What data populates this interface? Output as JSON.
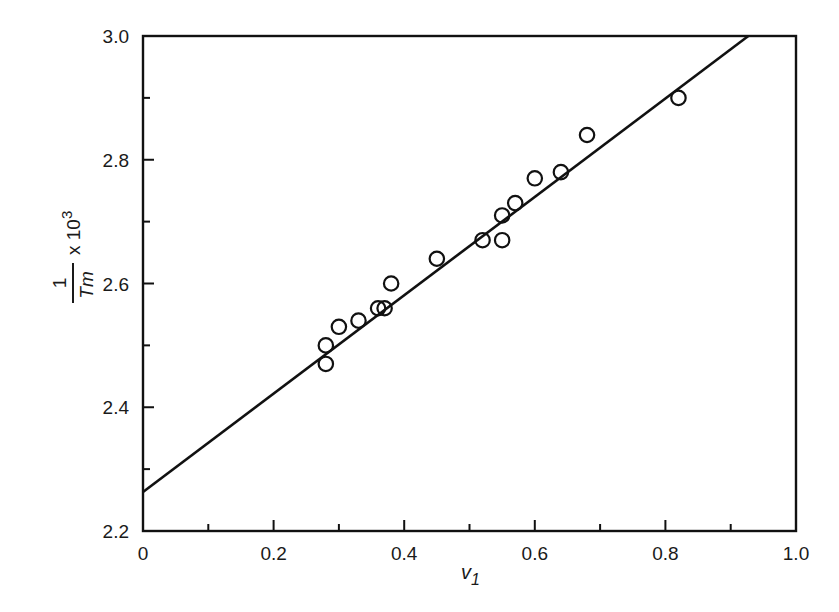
{
  "chart_data": {
    "type": "scatter",
    "title": "",
    "xlabel": "v1",
    "ylabel": "1/Tm x 10^3",
    "xlim": [
      0,
      1.0
    ],
    "ylim": [
      2.2,
      3.0
    ],
    "grid": false,
    "legend": null,
    "x_ticks": [
      "0",
      "0.2",
      "0.4",
      "0.6",
      "0.8",
      "1.0"
    ],
    "y_ticks": [
      "2.2",
      "2.4",
      "2.6",
      "2.8",
      "3.0"
    ],
    "series": [
      {
        "name": "data",
        "marker": "open-circle",
        "points": [
          {
            "x": 0.28,
            "y": 2.5
          },
          {
            "x": 0.28,
            "y": 2.47
          },
          {
            "x": 0.3,
            "y": 2.53
          },
          {
            "x": 0.33,
            "y": 2.54
          },
          {
            "x": 0.36,
            "y": 2.56
          },
          {
            "x": 0.37,
            "y": 2.56
          },
          {
            "x": 0.38,
            "y": 2.6
          },
          {
            "x": 0.45,
            "y": 2.64
          },
          {
            "x": 0.52,
            "y": 2.67
          },
          {
            "x": 0.55,
            "y": 2.67
          },
          {
            "x": 0.55,
            "y": 2.71
          },
          {
            "x": 0.57,
            "y": 2.73
          },
          {
            "x": 0.6,
            "y": 2.77
          },
          {
            "x": 0.64,
            "y": 2.78
          },
          {
            "x": 0.68,
            "y": 2.84
          },
          {
            "x": 0.82,
            "y": 2.9
          }
        ]
      },
      {
        "name": "linear fit",
        "type": "line",
        "intercept": 2.263,
        "slope": 0.795,
        "x_range": [
          0,
          0.927
        ]
      }
    ]
  },
  "labels": {
    "xlabel_main": "v",
    "xlabel_sub": "1",
    "ylabel_num": "1",
    "ylabel_den": "T",
    "ylabel_den_sub": "m",
    "ylabel_mult": "x 10",
    "ylabel_exp": "3"
  }
}
